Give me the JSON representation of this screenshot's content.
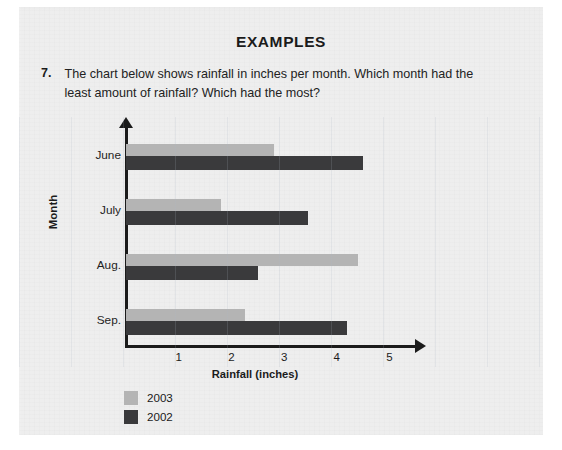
{
  "page": {
    "heading": "EXAMPLES",
    "question_number": "7.",
    "question_text": "The chart below shows rainfall in inches per month. Which month had the least amount of rainfall? Which had the most?"
  },
  "colors": {
    "paper": "#eeeeee",
    "ink": "#1b1b1b",
    "series_2003": "#b4b4b4",
    "series_2002": "#3a3a3c"
  },
  "chart_data": {
    "type": "bar",
    "orientation": "horizontal",
    "title": "",
    "xlabel": "Rainfall (inches)",
    "ylabel": "Month",
    "categories": [
      "June",
      "July",
      "Aug.",
      "Sep."
    ],
    "xticks": [
      "1",
      "2",
      "3",
      "4",
      "5"
    ],
    "xlim": [
      0,
      5.5
    ],
    "grid": false,
    "legend_position": "bottom-left",
    "series": [
      {
        "name": "2003",
        "color": "#b4b4b4",
        "values": [
          2.8,
          1.8,
          4.4,
          2.25
        ]
      },
      {
        "name": "2002",
        "color": "#3a3a3c",
        "values": [
          4.5,
          3.45,
          2.5,
          4.2
        ]
      }
    ]
  }
}
